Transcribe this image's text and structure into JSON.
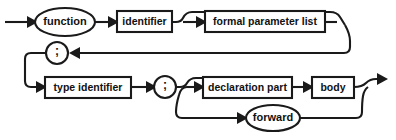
{
  "diagram": {
    "kind": "railroad-syntax-diagram",
    "stroke_color": "#1a1a1a",
    "fill_color": "#ffffff",
    "background": "#ffffff",
    "nodes": [
      {
        "id": "function-keyword",
        "label": "function",
        "shape": "ellipse",
        "cx": 65,
        "cy": 22,
        "rx": 30,
        "ry": 14,
        "font": "label-11"
      },
      {
        "id": "identifier",
        "label": "identifier",
        "shape": "box",
        "x": 117,
        "y": 11,
        "width": 55,
        "height": 21,
        "font": "label-10"
      },
      {
        "id": "formal-parameter-list",
        "label": "formal parameter list",
        "shape": "box",
        "x": 205,
        "y": 11,
        "width": 120,
        "height": 21,
        "font": "label-10"
      },
      {
        "id": "semicolon-1",
        "label": ";",
        "shape": "circle",
        "cx": 57,
        "cy": 53,
        "r": 11,
        "font": "label-semi"
      },
      {
        "id": "type-identifier",
        "label": "type identifier",
        "shape": "box",
        "x": 45,
        "y": 77,
        "width": 86,
        "height": 21,
        "font": "label-10"
      },
      {
        "id": "semicolon-2",
        "label": ";",
        "shape": "circle",
        "cx": 165,
        "cy": 87,
        "r": 11,
        "font": "label-semi"
      },
      {
        "id": "declaration-part",
        "label": "declaration part",
        "shape": "box",
        "x": 203,
        "y": 77,
        "width": 89,
        "height": 21,
        "font": "label-10"
      },
      {
        "id": "body",
        "label": "body",
        "shape": "box",
        "x": 312,
        "y": 77,
        "width": 42,
        "height": 21,
        "font": "label-10"
      },
      {
        "id": "forward-keyword",
        "label": "forward",
        "shape": "ellipse",
        "cx": 273,
        "cy": 118,
        "rx": 27,
        "ry": 13,
        "font": "label-11"
      }
    ],
    "paths": [
      {
        "id": "entry-line",
        "d": "M 5 22 L 34 22"
      },
      {
        "id": "function-to-identifier",
        "d": "M 95 22 L 116 22"
      },
      {
        "id": "identifier-to-fpl-up",
        "d": "M 172 22 L 176 22 Q 181 22 183 18 Q 186 12 192 12 L 198 12"
      },
      {
        "id": "fpl-entry-line",
        "d": "M 183 22 L 204 22"
      },
      {
        "id": "fpl-bypass-top",
        "d": "M 198 12 L 330 12 Q 337 12 340 17 L 345 25"
      },
      {
        "id": "fpl-exit-line",
        "d": "M 325 22 L 337 22"
      },
      {
        "id": "fpl-return-down",
        "d": "M 345 25 Q 350 34 350 41 L 350 47 Q 350 53 344 53 L 75 53"
      },
      {
        "id": "semicolon1-left-loop",
        "d": "M 46 53 L 31 53 Q 25 53 25 59 L 25 81 Q 25 87 31 87 L 44 87"
      },
      {
        "id": "typeid-to-semicolon2",
        "d": "M 131 87 L 153 87"
      },
      {
        "id": "semicolon2-to-decl-up",
        "d": "M 176 87 L 180 87 Q 185 87 187 83 Q 190 78 196 78 L 202 78"
      },
      {
        "id": "decl-entry-line",
        "d": "M 187 87 L 202 87"
      },
      {
        "id": "decl-to-body",
        "d": "M 292 87 L 311 87"
      },
      {
        "id": "body-to-exit",
        "d": "M 354 87 Q 362 87 366 83 Q 370 79 376 79 L 384 79"
      },
      {
        "id": "forward-branch-down",
        "d": "M 187 87 Q 181 87 179 95 Q 176 105 176 112 Q 176 118 182 118 L 244 118"
      },
      {
        "id": "forward-return",
        "d": "M 300 118 L 356 118 Q 362 118 362 112 Q 362 102 363 96 Q 364 90 368 87"
      }
    ],
    "arrowheads": [
      {
        "id": "arrow-into-function",
        "points": "27,16 38,22 27,28",
        "title": "arrow pointing into function node"
      },
      {
        "id": "arrow-into-identifier",
        "points": "108,16 119,22 108,28",
        "title": "arrow pointing into identifier box"
      },
      {
        "id": "arrow-into-fpl",
        "points": "196,16 207,22 196,28",
        "title": "arrow pointing into formal parameter list box"
      },
      {
        "id": "arrow-into-semicolon1",
        "points": "80,47 69,53 80,59",
        "title": "arrow pointing left into first semicolon"
      },
      {
        "id": "arrow-into-type-identifier",
        "points": "36,81 47,87 36,93",
        "title": "arrow pointing into type identifier box"
      },
      {
        "id": "arrow-into-semicolon2",
        "points": "146,81 157,87 146,93",
        "title": "arrow pointing into second semicolon"
      },
      {
        "id": "arrow-into-declaration",
        "points": "194,81 205,87 194,93",
        "title": "arrow pointing into declaration part box"
      },
      {
        "id": "arrow-into-body",
        "points": "303,81 314,87 303,93",
        "title": "arrow pointing into body box"
      },
      {
        "id": "arrow-into-forward",
        "points": "237,112 248,118 237,124",
        "title": "arrow pointing into forward node"
      },
      {
        "id": "arrow-exit",
        "points": "377,73 388,79 377,85",
        "title": "terminating exit arrow"
      }
    ]
  }
}
